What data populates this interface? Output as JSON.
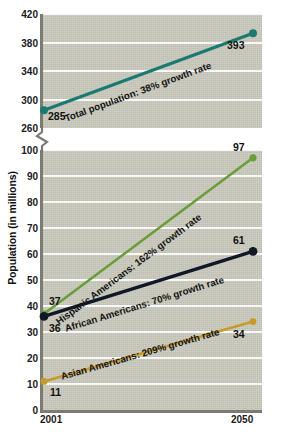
{
  "chart_data": {
    "type": "line",
    "title": "",
    "xlabel": "",
    "ylabel": "Population (in millions)",
    "x": [
      2001,
      2050
    ],
    "x_tick_labels": [
      "2001",
      "2050"
    ],
    "grid": true,
    "legend_position": "inline-labels",
    "broken_axis": true,
    "axis_segments": [
      {
        "name": "upper",
        "ylim": [
          260,
          420
        ],
        "ticks": [
          260,
          300,
          340,
          380,
          420
        ],
        "tick_labels": [
          "260",
          "300",
          "340",
          "380",
          "420"
        ]
      },
      {
        "name": "lower",
        "ylim": [
          0,
          100
        ],
        "ticks": [
          0,
          10,
          20,
          30,
          40,
          50,
          60,
          70,
          80,
          90,
          100
        ],
        "tick_labels": [
          "0",
          "10",
          "20",
          "30",
          "40",
          "50",
          "60",
          "70",
          "80",
          "90",
          "100"
        ]
      }
    ],
    "series": [
      {
        "name": "Total population",
        "label": "Total population: 38% growth rate",
        "growth_rate": "38%",
        "color": "#1a7a72",
        "segment": "upper",
        "values": [
          285,
          393
        ],
        "start_label": "285",
        "end_label": "393"
      },
      {
        "name": "Hispanic Americans",
        "label": "Hispanic Americans: 162% growth rate",
        "growth_rate": "162%",
        "color": "#6a9e3a",
        "segment": "lower",
        "values": [
          37,
          97
        ],
        "start_label": "37",
        "end_label": "97"
      },
      {
        "name": "African Americans",
        "label": "African Americans: 70% growth rate",
        "growth_rate": "70%",
        "color": "#101828",
        "segment": "lower",
        "values": [
          36,
          61
        ],
        "start_label": "36",
        "end_label": "61"
      },
      {
        "name": "Asian Americans",
        "label": "Asian Americans: 209% growth rate",
        "growth_rate": "209%",
        "color": "#c89a2a",
        "segment": "lower",
        "values": [
          11,
          34
        ],
        "start_label": "11",
        "end_label": "34"
      }
    ]
  },
  "colors": {
    "panel_background": "#c9c9bc",
    "gridline": "#ffffff",
    "axis": "#7b7b72",
    "page_background": "#ffffff",
    "text": "#111111"
  }
}
